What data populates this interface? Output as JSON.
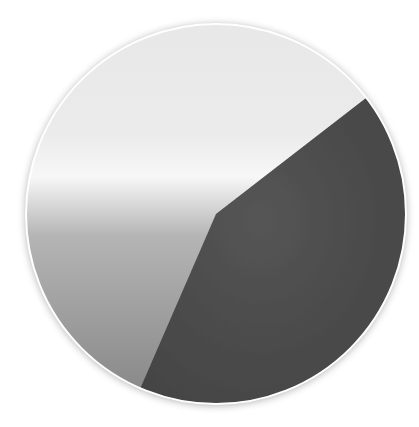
{
  "chart_data": {
    "type": "pie",
    "title": "",
    "xlabel": "",
    "ylabel": "",
    "legend": [],
    "labels_visible": false,
    "categories": [
      "Slice A (light)",
      "Slice B (dark)"
    ],
    "values": [
      58,
      42
    ],
    "colors": [
      "#e6e6e6",
      "#4a4a4a"
    ],
    "start_angle_deg": 37.7,
    "direction": "counterclockwise",
    "center": [
      216,
      214
    ],
    "radius": 190,
    "grid": false
  },
  "style": {
    "background": "#ffffff",
    "light_slice_top": "#e8e8e8",
    "light_slice_highlight": "#f7f7f7",
    "light_slice_bottom": "#8a8a8a",
    "dark_slice": "#4a4a4a",
    "rim": "#ffffff",
    "shadow": "#9a9a9a"
  }
}
